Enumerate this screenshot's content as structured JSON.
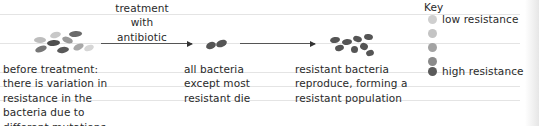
{
  "diagram": {
    "treatment_label": [
      "treatment",
      "with",
      "antibiotic"
    ],
    "stages": [
      {
        "id": "before",
        "caption": [
          "before treatment:",
          "there is variation in",
          "resistance in the",
          "bacteria due to",
          "different mutations"
        ]
      },
      {
        "id": "after_treatment",
        "caption": [
          "all bacteria",
          "except most",
          "resistant die"
        ]
      },
      {
        "id": "reproduce",
        "caption": [
          "resistant bacteria",
          "reproduce, forming a",
          "resistant population"
        ]
      }
    ],
    "key": {
      "title": "Key",
      "levels": [
        {
          "label": "low resistance",
          "color": "#cfcfcf"
        },
        {
          "label": "",
          "color": "#c0c0c0"
        },
        {
          "label": "",
          "color": "#a3a3a3"
        },
        {
          "label": "",
          "color": "#8a8a8a"
        },
        {
          "label": "high resistance",
          "color": "#5a5a5a"
        }
      ]
    },
    "colors": {
      "low": "#cfcfcf",
      "mid_low": "#b5b5b5",
      "mid": "#9a9a9a",
      "mid_high": "#7d7d7d",
      "high": "#555555"
    }
  }
}
